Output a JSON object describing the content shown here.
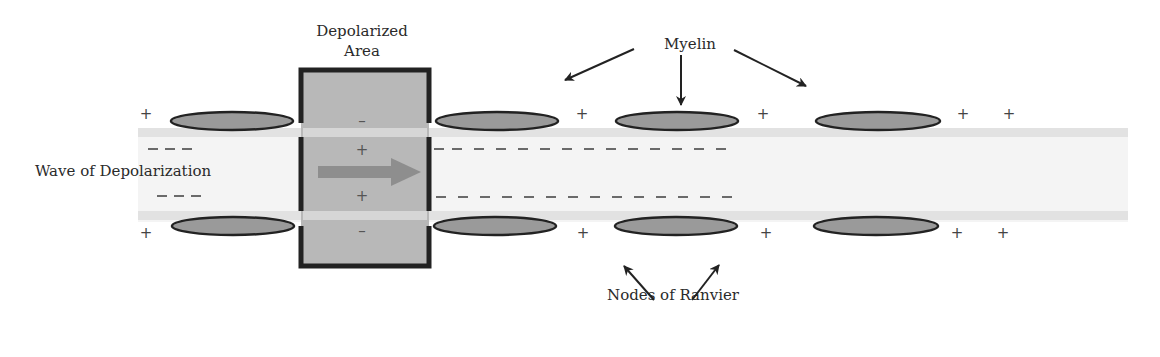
{
  "diagram": {
    "labels": {
      "depolarized_area_line1": "Depolarized",
      "depolarized_area_line2": "Area",
      "myelin": "Myelin",
      "wave": "Wave of Depolarization",
      "nodes": "Nodes of Ranvier"
    },
    "charges": {
      "plus": "+",
      "minus": "–"
    },
    "colors": {
      "axon_band": "#e6e6e6",
      "axon_interior": "#f3f3f3",
      "myelin_fill": "#9a9a9a",
      "myelin_stroke": "#222222",
      "depolarized_fill": "#b9b9b9",
      "depolarized_stroke": "#222222",
      "wave_arrow": "#8c8c8c",
      "dash": "#666666"
    },
    "myelin_sheaths": [
      {
        "cx": 212,
        "position": "top"
      },
      {
        "cx": 497,
        "position": "top"
      },
      {
        "cx": 697,
        "position": "top"
      },
      {
        "cx": 897,
        "position": "top"
      },
      {
        "cx": 212,
        "position": "bottom"
      },
      {
        "cx": 497,
        "position": "bottom"
      },
      {
        "cx": 697,
        "position": "bottom"
      },
      {
        "cx": 897,
        "position": "bottom"
      }
    ]
  }
}
